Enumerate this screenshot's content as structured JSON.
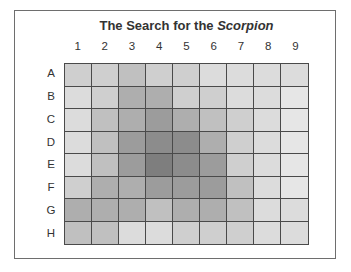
{
  "chart_data": {
    "type": "heatmap",
    "title": "The Search for the Scorpion",
    "title_parts": {
      "plain": "The Search for the ",
      "italic": "Scorpion"
    },
    "columns": [
      "1",
      "2",
      "3",
      "4",
      "5",
      "6",
      "7",
      "8",
      "9"
    ],
    "rows": [
      "A",
      "B",
      "C",
      "D",
      "E",
      "F",
      "G",
      "H"
    ],
    "scale_note": "shade intensity 1 (lightest) to 8 (darkest); no numeric labels shown",
    "values": [
      [
        3,
        3,
        4,
        3,
        3,
        2,
        2,
        2,
        2
      ],
      [
        2,
        3,
        5,
        5,
        3,
        3,
        2,
        2,
        1
      ],
      [
        2,
        4,
        5,
        6,
        5,
        4,
        3,
        2,
        1
      ],
      [
        2,
        4,
        6,
        7,
        7,
        5,
        3,
        2,
        1
      ],
      [
        2,
        4,
        6,
        8,
        7,
        6,
        3,
        2,
        1
      ],
      [
        3,
        5,
        5,
        6,
        6,
        6,
        4,
        2,
        1
      ],
      [
        5,
        5,
        5,
        4,
        5,
        5,
        4,
        2,
        2
      ],
      [
        4,
        4,
        2,
        2,
        3,
        3,
        3,
        2,
        2
      ]
    ],
    "palette": {
      "1": "#e6e6e6",
      "2": "#dcdcdc",
      "3": "#cfcfcf",
      "4": "#c0c0c0",
      "5": "#aeaeae",
      "6": "#9c9c9c",
      "7": "#8c8c8c",
      "8": "#7e7e7e"
    },
    "legend": null,
    "grid": true
  }
}
